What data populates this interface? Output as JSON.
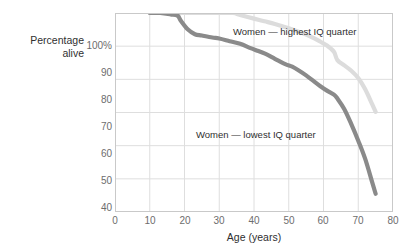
{
  "chart_data": {
    "type": "line",
    "title": "",
    "subtitle": "",
    "xlabel": "Age (years)",
    "ylabel_line1": "Percentage",
    "ylabel_line2": "alive",
    "xlim": [
      0,
      80
    ],
    "ylim": [
      40,
      100
    ],
    "xticks": [
      "0",
      "10",
      "20",
      "30",
      "40",
      "50",
      "60",
      "70",
      "80"
    ],
    "xtick_values": [
      0,
      10,
      20,
      30,
      40,
      50,
      60,
      70,
      80
    ],
    "yticks": [
      "40",
      "50",
      "60",
      "70",
      "80",
      "90",
      "100%"
    ],
    "ytick_values": [
      40,
      50,
      60,
      70,
      80,
      90,
      100
    ],
    "grid": true,
    "legend_position": "inline-annotation",
    "series": [
      {
        "name": "Women — highest IQ quarter",
        "color": "#dcdcdc",
        "x": [
          10,
          13,
          17,
          20,
          25,
          30,
          34,
          36,
          40,
          43,
          46,
          50,
          53,
          56,
          59,
          61,
          63,
          64,
          66,
          68,
          70,
          72,
          74,
          75
        ],
        "values": [
          100,
          100,
          100,
          100,
          100,
          100,
          100,
          99.4,
          98.3,
          97.5,
          96.7,
          95.4,
          94.3,
          93.0,
          91.4,
          90.2,
          88.3,
          85.8,
          84.2,
          82.6,
          80.4,
          77.0,
          72.5,
          70.2
        ]
      },
      {
        "name": "Women — lowest IQ quarter",
        "color": "#8a8a8a",
        "x": [
          10,
          13,
          16,
          18,
          19,
          21,
          23,
          25,
          28,
          30,
          33,
          36,
          39,
          41,
          43,
          46,
          49,
          51,
          53,
          55,
          57,
          59,
          61,
          63,
          64,
          66,
          68,
          70,
          72,
          74,
          75
        ],
        "values": [
          100,
          100,
          99.6,
          99.2,
          97.6,
          95.0,
          93.6,
          93.2,
          92.6,
          92.3,
          91.5,
          90.7,
          89.4,
          88.6,
          87.8,
          86.2,
          84.6,
          83.8,
          82.6,
          81.2,
          79.6,
          78.0,
          76.6,
          75.4,
          74.2,
          71.0,
          66.5,
          61.5,
          56.0,
          49.0,
          45.5
        ]
      }
    ],
    "annotations": [
      {
        "text": "Women — highest IQ quarter",
        "x": 44,
        "y": 102
      },
      {
        "text": "Women — lowest IQ quarter",
        "x": 32,
        "y": 70.5
      }
    ]
  },
  "colors": {
    "background": "#ffffff",
    "frame": "#c9c9c9",
    "grid": "#dedede",
    "text": "#2f2f2f",
    "tick_text": "#6d6d6d",
    "series_high": "#dcdcdc",
    "series_low": "#8a8a8a"
  }
}
